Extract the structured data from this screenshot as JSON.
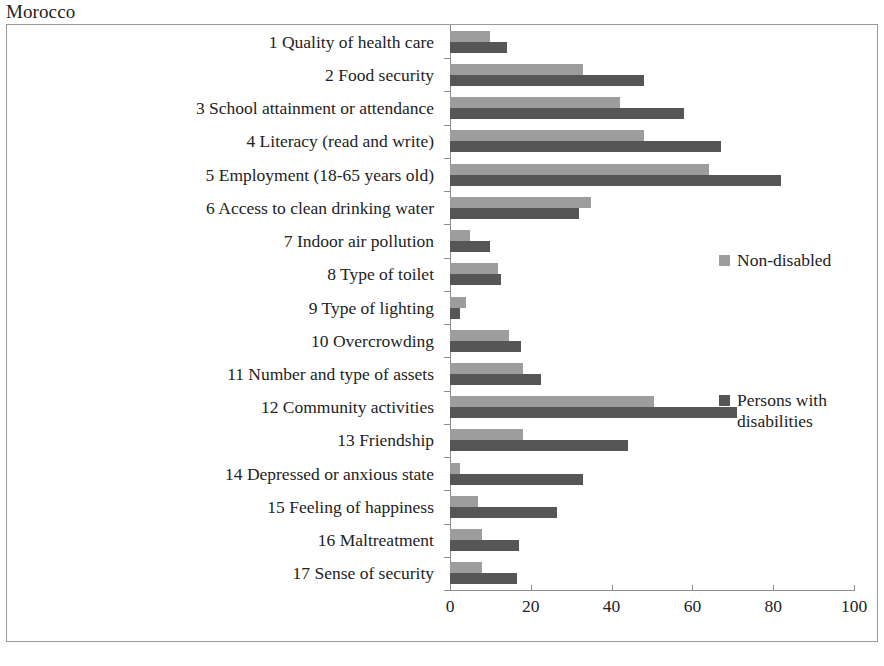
{
  "chart_data": {
    "type": "bar",
    "orientation": "horizontal",
    "title": "Morocco",
    "xlabel": "",
    "ylabel": "",
    "xlim": [
      0,
      100
    ],
    "xticks": [
      0,
      20,
      40,
      60,
      80,
      100
    ],
    "grid": false,
    "legend_position": "right",
    "categories": [
      "1 Quality of health care",
      "2 Food security",
      "3 School attainment or attendance",
      "4 Literacy (read and write)",
      "5 Employment  (18-65 years old)",
      "6 Access to clean drinking water",
      "7 Indoor air pollution",
      "8 Type of toilet",
      "9 Type of lighting",
      "10 Overcrowding",
      "11 Number and type of assets",
      "12 Community activities",
      "13 Friendship",
      "14 Depressed or anxious state",
      "15 Feeling of happiness",
      "16 Maltreatment",
      "17 Sense of security"
    ],
    "series": [
      {
        "name": "Non-disabled",
        "color": "#9d9d9d",
        "values": [
          10,
          33,
          42,
          48,
          64,
          35,
          5,
          12,
          4,
          14.5,
          18,
          50.5,
          18,
          2.5,
          7,
          8,
          8
        ]
      },
      {
        "name": "Persons with disabilities",
        "color": "#565656",
        "values": [
          14,
          48,
          58,
          67,
          82,
          32,
          10,
          12.5,
          2.5,
          17.5,
          22.5,
          71,
          44,
          33,
          26.5,
          17,
          16.5
        ]
      }
    ]
  },
  "legend": {
    "entries": [
      {
        "label": "Non-disabled",
        "color": "#9d9d9d"
      },
      {
        "label": "Persons with disabilities",
        "color": "#565656"
      }
    ]
  }
}
